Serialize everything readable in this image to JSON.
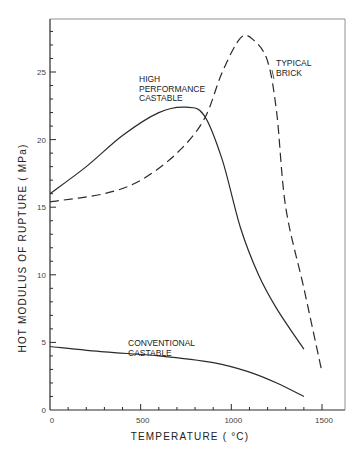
{
  "chart_data": {
    "type": "line",
    "title": "",
    "xlabel": "TEMPERATURE (°C)",
    "ylabel": "HOT MODULUS OF RUPTURE (MPa)",
    "xlim": [
      0,
      1600
    ],
    "ylim": [
      0,
      28
    ],
    "x_ticks": [
      0,
      500,
      1000,
      1500
    ],
    "x_tick_labels": [
      "0",
      "500",
      "1000",
      "1500"
    ],
    "y_ticks": [
      0,
      5,
      10,
      15,
      20,
      25
    ],
    "y_tick_labels": [
      "0",
      "5",
      "10",
      "15",
      "20",
      "25"
    ],
    "grid": false,
    "legend": "none (inline annotations)",
    "series": [
      {
        "name": "HIGH PERFORMANCE CASTABLE",
        "style": "solid",
        "x": [
          0,
          200,
          400,
          600,
          750,
          850,
          950,
          1050,
          1150,
          1250,
          1400
        ],
        "y": [
          16.0,
          18.0,
          20.3,
          22.0,
          22.4,
          21.8,
          18.5,
          13.5,
          10.0,
          7.5,
          4.5
        ]
      },
      {
        "name": "TYPICAL BRICK",
        "style": "dashed",
        "x": [
          0,
          300,
          500,
          700,
          850,
          950,
          1050,
          1120,
          1200,
          1250,
          1300,
          1400,
          1500
        ],
        "y": [
          15.4,
          16.0,
          17.0,
          19.0,
          21.5,
          25.0,
          27.5,
          27.4,
          25.8,
          22.0,
          15.0,
          9.0,
          2.8
        ]
      },
      {
        "name": "CONVENTIONAL CASTABLE",
        "style": "solid",
        "x": [
          0,
          300,
          600,
          900,
          1100,
          1250,
          1400
        ],
        "y": [
          4.7,
          4.3,
          4.0,
          3.5,
          2.8,
          2.0,
          1.0
        ]
      }
    ],
    "annotations": [
      {
        "lines": [
          "HIGH",
          "PERFORMANCE",
          "CASTABLE"
        ],
        "x": 560,
        "y": 24.3
      },
      {
        "lines": [
          "TYPICAL",
          "BRICK"
        ],
        "x": 1250,
        "y": 26.2
      },
      {
        "lines": [
          "CONVENTIONAL",
          "CASTABLE"
        ],
        "x": 590,
        "y": 5.6
      }
    ]
  },
  "labels": {
    "xlabel": "TEMPERATURE   ( °C)",
    "ylabel": "HOT  MODULUS  OF  RUPTURE  ( MPa)",
    "hpc": [
      "HIGH",
      "PERFORMANCE",
      "CASTABLE"
    ],
    "brick": [
      "TYPICAL",
      "BRICK"
    ],
    "conv": [
      "CONVENTIONAL",
      "CASTABLE"
    ]
  },
  "colors": {
    "ink": "#2a2a2a",
    "background": "#ffffff"
  }
}
